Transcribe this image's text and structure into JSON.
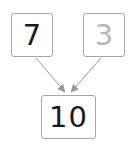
{
  "diagram": {
    "type": "addition-bond",
    "operands": [
      {
        "value": "7",
        "state": "filled",
        "color": "#1a1a1a"
      },
      {
        "value": "3",
        "state": "faded",
        "color": "#b8b8b8"
      }
    ],
    "result": {
      "value": "10",
      "color": "#1a1a1a"
    },
    "arrow_color": "#999999",
    "border_color": "#a6a6a6"
  }
}
